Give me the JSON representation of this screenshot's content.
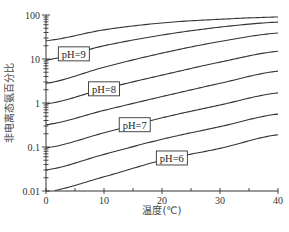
{
  "chart_data": {
    "type": "line",
    "title": "",
    "xlabel": "温度(℃)",
    "ylabel": "非电离态氨百分比",
    "xlim": [
      0,
      40
    ],
    "ylim": [
      0.01,
      100
    ],
    "yscale": "log",
    "grid": false,
    "x": [
      0,
      10,
      20,
      30,
      40
    ],
    "x_ticks": [
      "0",
      "10",
      "20",
      "30",
      "40"
    ],
    "y_ticks": [
      "0.01",
      "0.1",
      "1",
      "10",
      "100"
    ],
    "series": [
      {
        "name": "pH=9.5",
        "labeled": false,
        "values": [
          26,
          46,
          66,
          80,
          90
        ]
      },
      {
        "name": "pH=9",
        "labeled": true,
        "label": "pH=9",
        "label_at_x": 4.8,
        "values": [
          9.5,
          20,
          35,
          53,
          69
        ]
      },
      {
        "name": "pH=8.5",
        "labeled": false,
        "values": [
          2.8,
          6.5,
          13.6,
          25,
          39
        ]
      },
      {
        "name": "pH=8",
        "labeled": true,
        "label": "pH=8",
        "label_at_x": 10,
        "values": [
          0.95,
          2.1,
          4.3,
          8.5,
          15
        ]
      },
      {
        "name": "pH=7.5",
        "labeled": false,
        "values": [
          0.32,
          0.68,
          1.4,
          2.8,
          5.3
        ]
      },
      {
        "name": "pH=7",
        "labeled": true,
        "label": "pH=7",
        "label_at_x": 15.3,
        "values": [
          0.095,
          0.21,
          0.46,
          0.9,
          1.7
        ]
      },
      {
        "name": "pH=6.5",
        "labeled": false,
        "values": [
          0.03,
          0.068,
          0.15,
          0.29,
          0.56
        ]
      },
      {
        "name": "pH=6",
        "labeled": true,
        "label": "pH=6",
        "label_at_x": 21.7,
        "values": [
          0.0095,
          0.021,
          0.05,
          0.093,
          0.19
        ]
      }
    ]
  }
}
